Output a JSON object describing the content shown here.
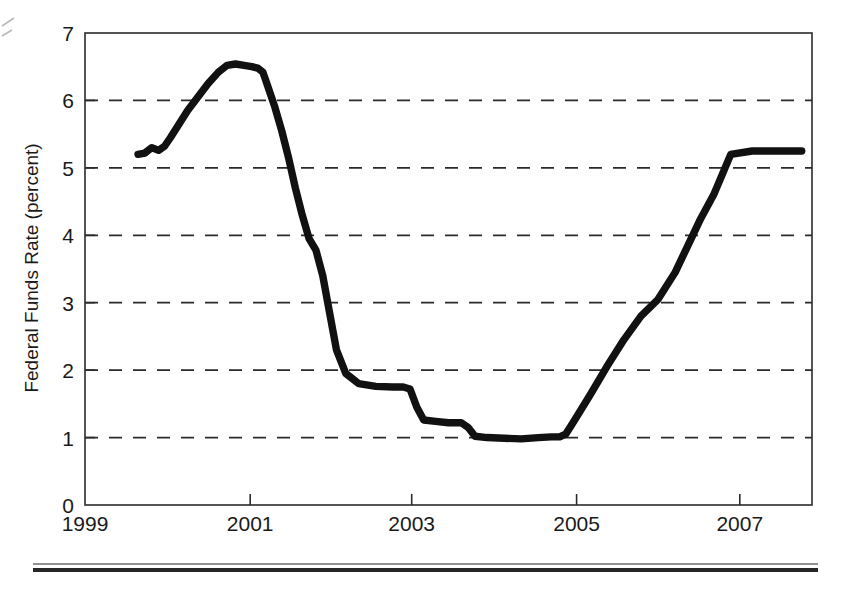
{
  "chart_data": {
    "type": "line",
    "title": "",
    "subtitle": "",
    "xlabel": "",
    "ylabel": "Federal Funds Rate (percent)",
    "xlim": [
      1999.0,
      2007.5
    ],
    "ylim": [
      0,
      7
    ],
    "grid": "horizontal-dashed",
    "legend": "none",
    "y_ticks": [
      0,
      1,
      2,
      3,
      4,
      5,
      6,
      7
    ],
    "y_tick_labels": [
      "0",
      "1",
      "2",
      "3",
      "4",
      "5",
      "6",
      "7"
    ],
    "x_ticks": [
      1999,
      2001,
      2003,
      2005,
      2007
    ],
    "x_tick_labels": [
      "1999",
      "2001",
      "2003",
      "2005",
      "2007"
    ],
    "gridline_values": [
      1,
      2,
      3,
      4,
      5,
      6
    ],
    "series": [
      {
        "name": "Federal Funds Rate",
        "color": "#111111",
        "x": [
          1999.62,
          1999.7,
          1999.78,
          1999.86,
          1999.93,
          2000.0,
          2000.1,
          2000.2,
          2000.32,
          2000.44,
          2000.56,
          2000.66,
          2000.76,
          2000.86,
          2000.95,
          2001.02,
          2001.08,
          2001.14,
          2001.22,
          2001.3,
          2001.38,
          2001.46,
          2001.54,
          2001.62,
          2001.7,
          2001.78,
          2001.86,
          2001.94,
          2002.05,
          2002.2,
          2002.4,
          2002.6,
          2002.72,
          2002.8,
          2002.88,
          2002.96,
          2003.1,
          2003.25,
          2003.4,
          2003.48,
          2003.56,
          2003.7,
          2003.9,
          2004.1,
          2004.3,
          2004.45,
          2004.55,
          2004.62,
          2004.72,
          2004.9,
          2005.1,
          2005.3,
          2005.5,
          2005.7,
          2005.9,
          2006.05,
          2006.2,
          2006.35,
          2006.45,
          2006.55,
          2006.8,
          2007.0,
          2007.2,
          2007.38
        ],
        "y": [
          5.2,
          5.22,
          5.3,
          5.26,
          5.32,
          5.45,
          5.65,
          5.85,
          6.05,
          6.25,
          6.42,
          6.52,
          6.54,
          6.52,
          6.5,
          6.48,
          6.42,
          6.2,
          5.9,
          5.55,
          5.15,
          4.7,
          4.3,
          3.95,
          3.78,
          3.4,
          2.85,
          2.3,
          1.95,
          1.8,
          1.76,
          1.75,
          1.75,
          1.72,
          1.45,
          1.26,
          1.24,
          1.22,
          1.22,
          1.15,
          1.02,
          1.0,
          0.99,
          0.98,
          1.0,
          1.01,
          1.01,
          1.05,
          1.25,
          1.62,
          2.05,
          2.45,
          2.8,
          3.05,
          3.45,
          3.85,
          4.25,
          4.6,
          4.9,
          5.2,
          5.25,
          5.25,
          5.25,
          5.25
        ]
      }
    ],
    "notes": {
      "peak_value": 6.54,
      "peak_period": "2000 mid-to-late",
      "trough_value": 0.98,
      "trough_period": "2003-2004",
      "final_value": 5.25,
      "final_period": "2006-2007"
    }
  },
  "axes": {
    "y_axis_title": "Federal Funds Rate (percent)"
  }
}
